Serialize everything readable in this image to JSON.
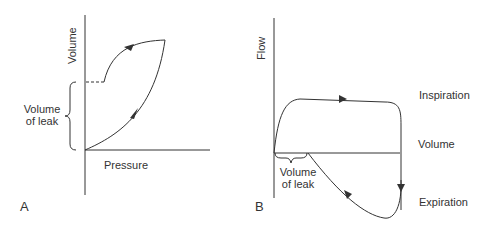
{
  "panels": [
    {
      "id": "A",
      "letter": "A",
      "x_axis_label": "Pressure",
      "y_axis_label": "Volume",
      "annotation": [
        "Volume",
        "of leak"
      ],
      "description": "Pressure-volume loop with leak: expiratory limb does not return to zero volume"
    },
    {
      "id": "B",
      "letter": "B",
      "x_axis_label": "Volume",
      "y_axis_label": "Flow",
      "annotation": [
        "Volume",
        "of leak"
      ],
      "phase_labels": [
        "Inspiration",
        "Expiration"
      ],
      "description": "Flow-volume loop with leak: expiratory limb does not return to origin"
    }
  ],
  "colors": {
    "line": "#333333",
    "background": "#ffffff"
  }
}
